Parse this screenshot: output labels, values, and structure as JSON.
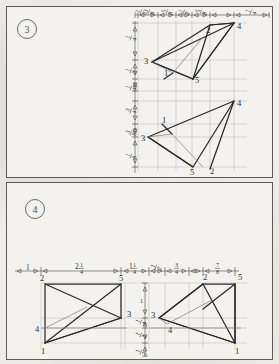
{
  "document": {
    "title": "Orthographic Projection Exercise Sheet",
    "paper_color": "#f0efeb",
    "ink_color": "#2b2a28",
    "guide_color": "#b9b7b0"
  },
  "panels": [
    {
      "id": "panel-3",
      "badge": "3",
      "badge_label": "problem-number-3",
      "horizontal_dimensions": [
        {
          "whole": "",
          "num": "1",
          "den": "2"
        },
        {
          "whole": "",
          "num": "3",
          "den": "8"
        },
        {
          "whole": "",
          "num": "5",
          "den": "8"
        },
        {
          "whole": "",
          "num": "1",
          "den": "2"
        },
        {
          "whole": "",
          "num": "5",
          "den": "8"
        },
        {
          "whole": "",
          "num": "1",
          "den": "4"
        }
      ],
      "vertical_dimensions": [
        {
          "whole": "",
          "num": "1",
          "den": "4"
        },
        {
          "whole": "",
          "num": "1",
          "den": "2"
        },
        {
          "whole": "",
          "num": "1",
          "den": "4"
        },
        {
          "whole": "",
          "num": "3",
          "den": "4"
        },
        {
          "whole": "",
          "num": "3",
          "den": "8"
        },
        {
          "whole": "",
          "num": "1",
          "den": "8"
        }
      ],
      "figures": [
        {
          "name": "upper-triangle-group",
          "vertex_labels": [
            "2",
            "4",
            "3",
            "1",
            "5"
          ]
        },
        {
          "name": "lower-triangle-group",
          "vertex_labels": [
            "4",
            "1",
            "3",
            "5",
            "2"
          ]
        }
      ]
    },
    {
      "id": "panel-4",
      "badge": "4",
      "badge_label": "problem-number-4",
      "horizontal_dimensions": [
        {
          "whole": "1",
          "num": "",
          "den": ""
        },
        {
          "whole": "2",
          "num": "1",
          "den": "4"
        },
        {
          "whole": "1",
          "num": "1",
          "den": "4"
        },
        {
          "whole": "",
          "num": "1",
          "den": "2"
        },
        {
          "whole": "",
          "num": "3",
          "den": "4"
        },
        {
          "whole": "",
          "num": "7",
          "den": "8"
        }
      ],
      "vertical_dimensions": [
        {
          "whole": "",
          "num": "1",
          "den": "1"
        },
        {
          "whole": "",
          "num": "1",
          "den": "4"
        },
        {
          "whole": "",
          "num": "1",
          "den": "2"
        },
        {
          "whole": "",
          "num": "1",
          "den": "2"
        }
      ],
      "figures": [
        {
          "name": "left-rectangle-figure",
          "vertex_labels": [
            "2",
            "5",
            "3",
            "4",
            "1"
          ]
        },
        {
          "name": "right-triangle-figure",
          "vertex_labels": [
            "3",
            "2",
            "5",
            "4",
            "1"
          ]
        }
      ]
    }
  ]
}
